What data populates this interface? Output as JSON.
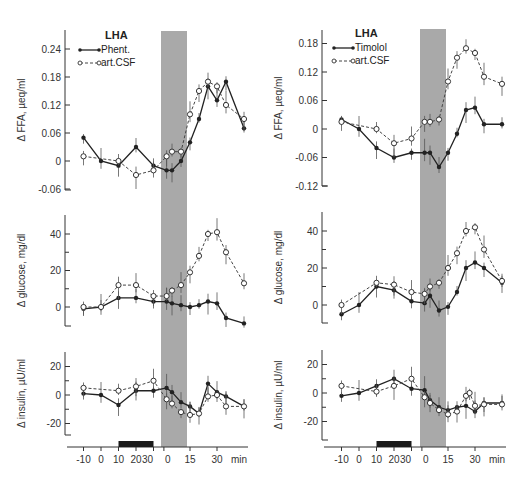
{
  "figure": {
    "left_title": "LHA",
    "right_title": "LHA",
    "x_unit": "min",
    "x_tick_labels": [
      "-10",
      "0",
      "10",
      "20",
      "30",
      "0",
      "15",
      "30"
    ]
  },
  "colors": {
    "shade": "#a9a9a9",
    "line": "#222222",
    "bar": "#1a1a1a"
  },
  "chart_data": [
    {
      "type": "line",
      "panel": "left-top",
      "title": "LHA",
      "ylabel": "Δ FFA, µeq/ml",
      "ylim": [
        -0.06,
        0.26
      ],
      "yticks": [
        "0.24",
        "0.18",
        "0.12",
        "0.06",
        "0",
        "-0.06"
      ],
      "legend": [
        "Phent.",
        "art.CSF"
      ],
      "series": [
        {
          "name": "Phent.",
          "x": [
            -10,
            0,
            10,
            20,
            30,
            32,
            35,
            40,
            45,
            50,
            55,
            60,
            65,
            75
          ],
          "values": [
            0.05,
            0,
            -0.01,
            0.03,
            -0.01,
            -0.02,
            -0.02,
            0,
            0.04,
            0.09,
            0.16,
            0.13,
            0.17,
            0.07
          ]
        },
        {
          "name": "art.CSF",
          "x": [
            -10,
            10,
            20,
            30,
            32,
            35,
            40,
            45,
            50,
            55,
            60,
            65,
            75
          ],
          "values": [
            0.01,
            0,
            -0.03,
            -0.02,
            0.01,
            0.02,
            0.02,
            0.1,
            0.15,
            0.17,
            0.16,
            0.12,
            0.09
          ]
        }
      ]
    },
    {
      "type": "line",
      "panel": "left-middle",
      "ylabel": "Δ glucose, mg/dl",
      "ylim": [
        -10,
        50
      ],
      "yticks": [
        "40",
        "20",
        "0"
      ],
      "series": [
        {
          "name": "Phent.",
          "x": [
            -10,
            0,
            10,
            20,
            30,
            32,
            35,
            40,
            45,
            50,
            55,
            60,
            65,
            75
          ],
          "values": [
            -1,
            0,
            5,
            5,
            3,
            3,
            2,
            1,
            0,
            1,
            3,
            2,
            -6,
            -9
          ]
        },
        {
          "name": "art.CSF",
          "x": [
            -10,
            0,
            10,
            20,
            30,
            32,
            35,
            40,
            45,
            50,
            55,
            60,
            65,
            75
          ],
          "values": [
            0,
            0,
            12,
            12,
            6,
            6,
            9,
            12,
            19,
            28,
            40,
            41,
            30,
            13
          ]
        }
      ]
    },
    {
      "type": "line",
      "panel": "left-bottom",
      "ylabel": "Δ insulin, µU/ml",
      "ylim": [
        -30,
        30
      ],
      "yticks": [
        "20",
        "0",
        "-20"
      ],
      "series": [
        {
          "name": "Phent.",
          "x": [
            -10,
            0,
            10,
            20,
            30,
            32,
            35,
            40,
            45,
            50,
            55,
            60,
            65,
            75
          ],
          "values": [
            1,
            0,
            -7,
            3,
            3,
            5,
            2,
            -5,
            -8,
            -13,
            8,
            2,
            -1,
            -8
          ]
        },
        {
          "name": "art.CSF",
          "x": [
            -10,
            10,
            20,
            30,
            32,
            35,
            40,
            45,
            50,
            55,
            60,
            65,
            75
          ],
          "values": [
            5,
            3,
            6,
            10,
            -3,
            -6,
            -12,
            -14,
            -13,
            -1,
            0,
            -8,
            -8
          ]
        }
      ],
      "infusion_bar": {
        "from": 10,
        "to": 30
      }
    },
    {
      "type": "line",
      "panel": "right-top",
      "title": "LHA",
      "ylabel": "Δ FFA, µeq/ml",
      "ylim": [
        -0.12,
        0.2
      ],
      "yticks": [
        "0.18",
        "0.12",
        "0.06",
        "0",
        "-0.06",
        "-0.12"
      ],
      "legend": [
        "Timolol",
        "art.CSF"
      ],
      "series": [
        {
          "name": "Timolol",
          "x": [
            -10,
            0,
            10,
            20,
            30,
            32,
            35,
            40,
            45,
            50,
            55,
            60,
            65,
            75
          ],
          "values": [
            0.02,
            0,
            -0.04,
            -0.06,
            -0.05,
            -0.05,
            -0.05,
            -0.08,
            -0.05,
            -0.01,
            0.04,
            0.045,
            0.01,
            0.01
          ]
        },
        {
          "name": "art.CSF",
          "x": [
            -10,
            10,
            20,
            30,
            32,
            35,
            40,
            45,
            50,
            55,
            60,
            65,
            75
          ],
          "values": [
            0.015,
            0,
            -0.03,
            -0.02,
            0.015,
            0.015,
            0.02,
            0.1,
            0.15,
            0.17,
            0.16,
            0.11,
            0.095
          ]
        }
      ]
    },
    {
      "type": "line",
      "panel": "right-middle",
      "ylabel": "Δ glucose, mg/dl",
      "ylim": [
        -10,
        50
      ],
      "yticks": [
        "40",
        "20",
        "0"
      ],
      "series": [
        {
          "name": "Timolol",
          "x": [
            -10,
            0,
            10,
            20,
            30,
            32,
            35,
            40,
            45,
            50,
            55,
            60,
            65,
            75
          ],
          "values": [
            -5,
            0,
            10,
            8,
            2,
            1,
            5,
            -3,
            -1,
            7,
            20,
            23,
            20,
            12
          ]
        },
        {
          "name": "art.CSF",
          "x": [
            -10,
            10,
            20,
            30,
            32,
            35,
            40,
            45,
            50,
            55,
            60,
            65,
            75
          ],
          "values": [
            0,
            12,
            11,
            7,
            6,
            10,
            12,
            20,
            28,
            40,
            42,
            30,
            13
          ]
        }
      ]
    },
    {
      "type": "line",
      "panel": "right-bottom",
      "ylabel": "Δ insulin, µU/ml",
      "ylim": [
        -30,
        30
      ],
      "yticks": [
        "20",
        "0",
        "-20"
      ],
      "series": [
        {
          "name": "Timolol",
          "x": [
            -10,
            0,
            10,
            20,
            30,
            32,
            35,
            40,
            45,
            50,
            55,
            60,
            65,
            75
          ],
          "values": [
            -2,
            0,
            5,
            10,
            3,
            2,
            -5,
            -10,
            -12,
            -10,
            -9,
            -13,
            -7,
            -7
          ]
        },
        {
          "name": "art.CSF",
          "x": [
            -10,
            10,
            20,
            30,
            32,
            35,
            40,
            45,
            50,
            55,
            57,
            60,
            65,
            75
          ],
          "values": [
            5,
            1,
            5,
            10,
            -3,
            -7,
            -12,
            -15,
            -13,
            -2,
            0,
            -9,
            -8,
            -8
          ]
        }
      ],
      "infusion_bar": {
        "from": 10,
        "to": 30
      }
    }
  ]
}
